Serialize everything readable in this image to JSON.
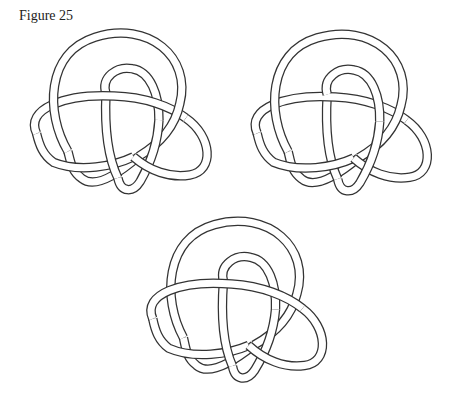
{
  "figure": {
    "caption": "Figure 25",
    "knots": [
      {
        "id": "knot-top-left",
        "position": "top-left"
      },
      {
        "id": "knot-top-right",
        "position": "top-right"
      },
      {
        "id": "knot-bottom-center",
        "position": "bottom-center"
      }
    ],
    "colors": {
      "stroke": "#333333",
      "fill": "#ffffff",
      "background": "#ffffff"
    }
  }
}
